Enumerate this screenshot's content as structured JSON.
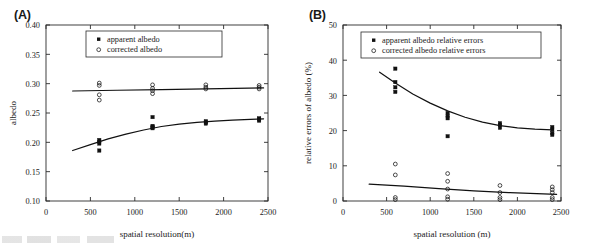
{
  "figure": {
    "panels": [
      {
        "id": "A",
        "label": "(A)",
        "legend": [
          {
            "marker": "filled-square",
            "text": "apparent albedo"
          },
          {
            "marker": "open-circle",
            "text": "corrected albedo"
          }
        ]
      },
      {
        "id": "B",
        "label": "(B)",
        "legend": [
          {
            "marker": "filled-square",
            "text": "apparent albedo relative errors"
          },
          {
            "marker": "open-circle",
            "text": "corrected albedo relative errors"
          }
        ]
      }
    ]
  },
  "chart_data": [
    {
      "type": "scatter",
      "panel": "A",
      "title": "(A)",
      "xlabel": "spatial resolution(m)",
      "ylabel": "albedo",
      "xlim": [
        0,
        2500
      ],
      "ylim": [
        0.1,
        0.4
      ],
      "xticks": [
        0,
        500,
        1000,
        1500,
        2000,
        2500
      ],
      "xticklabels": [
        "0",
        "500",
        "1000",
        "1500",
        "2000",
        "2500"
      ],
      "yticks": [
        0.1,
        0.15,
        0.2,
        0.25,
        0.3,
        0.35,
        0.4
      ],
      "yticklabels": [
        "0.10",
        "0.15",
        "0.20",
        "0.25",
        "0.30",
        "0.35",
        "0.40"
      ],
      "grid": false,
      "legend_position": "upper-center",
      "series": [
        {
          "name": "apparent albedo",
          "marker": "filled-square",
          "points": [
            {
              "x": 600,
              "y": 0.204
            },
            {
              "x": 600,
              "y": 0.201
            },
            {
              "x": 600,
              "y": 0.198
            },
            {
              "x": 600,
              "y": 0.186
            },
            {
              "x": 1200,
              "y": 0.243
            },
            {
              "x": 1200,
              "y": 0.228
            },
            {
              "x": 1200,
              "y": 0.226
            },
            {
              "x": 1200,
              "y": 0.224
            },
            {
              "x": 1800,
              "y": 0.236
            },
            {
              "x": 1800,
              "y": 0.234
            },
            {
              "x": 1800,
              "y": 0.232
            },
            {
              "x": 2400,
              "y": 0.241
            },
            {
              "x": 2400,
              "y": 0.239
            },
            {
              "x": 2400,
              "y": 0.237
            }
          ]
        },
        {
          "name": "corrected albedo",
          "marker": "open-circle",
          "points": [
            {
              "x": 600,
              "y": 0.301
            },
            {
              "x": 600,
              "y": 0.297
            },
            {
              "x": 600,
              "y": 0.281
            },
            {
              "x": 600,
              "y": 0.272
            },
            {
              "x": 1200,
              "y": 0.298
            },
            {
              "x": 1200,
              "y": 0.292
            },
            {
              "x": 1200,
              "y": 0.288
            },
            {
              "x": 1200,
              "y": 0.283
            },
            {
              "x": 1800,
              "y": 0.298
            },
            {
              "x": 1800,
              "y": 0.294
            },
            {
              "x": 1800,
              "y": 0.291
            },
            {
              "x": 2400,
              "y": 0.297
            },
            {
              "x": 2400,
              "y": 0.294
            },
            {
              "x": 2400,
              "y": 0.291
            }
          ]
        }
      ],
      "fit_curves": [
        {
          "name": "apparent albedo fit",
          "points": [
            {
              "x": 300,
              "y": 0.186
            },
            {
              "x": 500,
              "y": 0.196
            },
            {
              "x": 700,
              "y": 0.206
            },
            {
              "x": 900,
              "y": 0.214
            },
            {
              "x": 1100,
              "y": 0.221
            },
            {
              "x": 1300,
              "y": 0.227
            },
            {
              "x": 1500,
              "y": 0.231
            },
            {
              "x": 1700,
              "y": 0.234
            },
            {
              "x": 1900,
              "y": 0.236
            },
            {
              "x": 2100,
              "y": 0.238
            },
            {
              "x": 2300,
              "y": 0.239
            },
            {
              "x": 2450,
              "y": 0.24
            }
          ]
        },
        {
          "name": "corrected albedo fit",
          "points": [
            {
              "x": 300,
              "y": 0.2875
            },
            {
              "x": 800,
              "y": 0.2888
            },
            {
              "x": 1300,
              "y": 0.29
            },
            {
              "x": 1800,
              "y": 0.2912
            },
            {
              "x": 2450,
              "y": 0.2928
            }
          ]
        }
      ]
    },
    {
      "type": "scatter",
      "panel": "B",
      "title": "(B)",
      "xlabel": "spatial resolution (m)",
      "ylabel": "relative errors of albedo (%)",
      "xlim": [
        0,
        2500
      ],
      "ylim": [
        0,
        50
      ],
      "xticks": [
        0,
        500,
        1000,
        1500,
        2000,
        2500
      ],
      "xticklabels": [
        "0",
        "500",
        "1000",
        "1500",
        "2000",
        "2500"
      ],
      "yticks": [
        0,
        10,
        20,
        30,
        40,
        50
      ],
      "yticklabels": [
        "0",
        "10",
        "20",
        "30",
        "40",
        "50"
      ],
      "grid": false,
      "legend_position": "upper-center",
      "series": [
        {
          "name": "apparent albedo relative errors",
          "marker": "filled-square",
          "points": [
            {
              "x": 600,
              "y": 37.6
            },
            {
              "x": 600,
              "y": 33.8
            },
            {
              "x": 600,
              "y": 32.3
            },
            {
              "x": 600,
              "y": 31.0
            },
            {
              "x": 1200,
              "y": 25.0
            },
            {
              "x": 1200,
              "y": 24.2
            },
            {
              "x": 1200,
              "y": 23.5
            },
            {
              "x": 1200,
              "y": 18.4
            },
            {
              "x": 1800,
              "y": 22.1
            },
            {
              "x": 1800,
              "y": 21.6
            },
            {
              "x": 1800,
              "y": 20.8
            },
            {
              "x": 2400,
              "y": 21.0
            },
            {
              "x": 2400,
              "y": 20.3
            },
            {
              "x": 2400,
              "y": 19.3
            },
            {
              "x": 2400,
              "y": 18.8
            }
          ]
        },
        {
          "name": "corrected albedo relative errors",
          "marker": "open-circle",
          "points": [
            {
              "x": 600,
              "y": 10.5
            },
            {
              "x": 600,
              "y": 7.4
            },
            {
              "x": 600,
              "y": 1.0
            },
            {
              "x": 600,
              "y": 0.4
            },
            {
              "x": 1200,
              "y": 7.8
            },
            {
              "x": 1200,
              "y": 5.6
            },
            {
              "x": 1200,
              "y": 3.4
            },
            {
              "x": 1200,
              "y": 1.2
            },
            {
              "x": 1200,
              "y": 0.5
            },
            {
              "x": 1800,
              "y": 4.4
            },
            {
              "x": 1800,
              "y": 2.4
            },
            {
              "x": 1800,
              "y": 1.0
            },
            {
              "x": 1800,
              "y": 0.4
            },
            {
              "x": 2400,
              "y": 4.0
            },
            {
              "x": 2400,
              "y": 3.2
            },
            {
              "x": 2400,
              "y": 2.4
            },
            {
              "x": 2400,
              "y": 1.0
            },
            {
              "x": 2400,
              "y": 0.4
            }
          ]
        }
      ],
      "fit_curves": [
        {
          "name": "apparent albedo relative errors fit",
          "points": [
            {
              "x": 420,
              "y": 36.6
            },
            {
              "x": 600,
              "y": 33.5
            },
            {
              "x": 800,
              "y": 30.4
            },
            {
              "x": 1000,
              "y": 27.8
            },
            {
              "x": 1200,
              "y": 25.6
            },
            {
              "x": 1400,
              "y": 23.8
            },
            {
              "x": 1600,
              "y": 22.4
            },
            {
              "x": 1800,
              "y": 21.4
            },
            {
              "x": 2000,
              "y": 20.8
            },
            {
              "x": 2200,
              "y": 20.4
            },
            {
              "x": 2400,
              "y": 20.2
            }
          ]
        },
        {
          "name": "corrected albedo relative errors fit",
          "points": [
            {
              "x": 300,
              "y": 4.8
            },
            {
              "x": 700,
              "y": 4.2
            },
            {
              "x": 1100,
              "y": 3.5
            },
            {
              "x": 1500,
              "y": 2.9
            },
            {
              "x": 1900,
              "y": 2.4
            },
            {
              "x": 2450,
              "y": 1.9
            }
          ]
        }
      ]
    }
  ]
}
